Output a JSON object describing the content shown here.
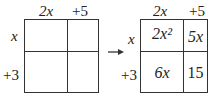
{
  "left_grid": {
    "col_headers": [
      "2x",
      "+5"
    ],
    "row_headers": [
      "x",
      "+3"
    ],
    "cells": [
      [
        "",
        ""
      ],
      [
        "",
        ""
      ]
    ]
  },
  "arrow": "right-arrow",
  "right_grid": {
    "col_headers": [
      "2x",
      "+5"
    ],
    "row_headers": [
      "x",
      "+3"
    ],
    "cells": [
      [
        "2x²",
        "5x"
      ],
      [
        "6x",
        "15"
      ]
    ]
  }
}
